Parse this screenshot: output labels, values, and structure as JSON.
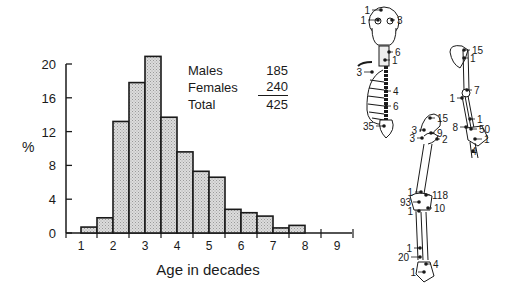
{
  "chart_data": {
    "type": "bar",
    "title": "",
    "xlabel": "Age in decades",
    "ylabel": "%",
    "ylim": [
      0,
      20
    ],
    "yticks": [
      0,
      4,
      8,
      12,
      16,
      20
    ],
    "xticks": [
      "1",
      "2",
      "3",
      "4",
      "5",
      "6",
      "7",
      "8",
      "9"
    ],
    "bin_width_decades": 0.5,
    "categories": [
      "1.0-1.5",
      "1.5-2.0",
      "2.0-2.5",
      "2.5-3.0",
      "3.0-3.5",
      "3.5-4.0",
      "4.0-4.5",
      "4.5-5.0",
      "5.0-5.5",
      "5.5-6.0",
      "6.0-6.5",
      "6.5-7.0",
      "7.0-7.5",
      "7.5-8.0"
    ],
    "values": [
      0.7,
      1.8,
      13.2,
      17.8,
      20.9,
      13.7,
      9.6,
      7.3,
      6.6,
      2.8,
      2.4,
      2.0,
      0.6,
      0.9
    ],
    "grid": false,
    "legend": {
      "position": "top-right inset",
      "rows": [
        {
          "label": "Males",
          "value": "185"
        },
        {
          "label": "Females",
          "value": "240"
        },
        {
          "label": "Total",
          "value": "425"
        }
      ]
    },
    "bar_fill": "#d4d4d4",
    "bar_edge": "#1a1a1a"
  },
  "skeleton_annotations": {
    "axial": [
      {
        "site": "skull-vertex",
        "count": "1"
      },
      {
        "site": "skull-left",
        "count": "1"
      },
      {
        "site": "skull-right",
        "count": "3"
      },
      {
        "site": "cervical-spine",
        "count": "6"
      },
      {
        "site": "upper-thoracic",
        "count": "1"
      },
      {
        "site": "ribs",
        "count": "3"
      },
      {
        "site": "thoracic-spine",
        "count": "4"
      },
      {
        "site": "lumbar-spine",
        "count": "6"
      },
      {
        "site": "sacrum",
        "count": "35"
      }
    ],
    "upper_limb": [
      {
        "site": "scapula",
        "count": "15"
      },
      {
        "site": "proximal-humerus",
        "count": "1"
      },
      {
        "site": "elbow",
        "count": "7"
      },
      {
        "site": "elbow-medial",
        "count": "1"
      },
      {
        "site": "distal-forearm",
        "count": "1"
      },
      {
        "site": "wrist-left",
        "count": "8"
      },
      {
        "site": "wrist-right",
        "count": "50"
      },
      {
        "site": "hand",
        "count": "1"
      },
      {
        "site": "fingers",
        "count": "4"
      }
    ],
    "lower_limb": [
      {
        "site": "ilium",
        "count": "15"
      },
      {
        "site": "acetabulum",
        "count": "3"
      },
      {
        "site": "hip-joint",
        "count": "9"
      },
      {
        "site": "ischium",
        "count": "3"
      },
      {
        "site": "femoral-neck",
        "count": "2"
      },
      {
        "site": "distal-femur",
        "count": "1"
      },
      {
        "site": "knee-lateral",
        "count": "118"
      },
      {
        "site": "knee-medial",
        "count": "93"
      },
      {
        "site": "proximal-tibia",
        "count": "1"
      },
      {
        "site": "proximal-tibia-lateral",
        "count": "10"
      },
      {
        "site": "distal-tibia",
        "count": "1"
      },
      {
        "site": "ankle-medial",
        "count": "20"
      },
      {
        "site": "ankle-lateral",
        "count": "4"
      },
      {
        "site": "foot",
        "count": "1"
      }
    ]
  }
}
